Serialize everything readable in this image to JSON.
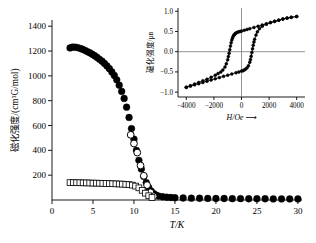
{
  "figure": {
    "background": "#ffffff",
    "foreground": "#000000"
  },
  "chart_data": [
    {
      "id": "main",
      "type": "scatter",
      "title": "",
      "xlabel": "T/K",
      "ylabel": "磁化强度/(cm³G/mol)",
      "xlim": [
        0,
        30.5
      ],
      "ylim": [
        0,
        1450
      ],
      "xticks": [
        0,
        5,
        10,
        15,
        20,
        25,
        30
      ],
      "xticklabels": [
        "0",
        "5",
        "10",
        "15",
        "20",
        "25",
        "30"
      ],
      "yticks": [
        200,
        400,
        600,
        800,
        1000,
        1200,
        1400
      ],
      "yticklabels": [
        "200",
        "400",
        "600",
        "800",
        "1000",
        "1200",
        "1400"
      ],
      "grid": false,
      "legend": false,
      "series": [
        {
          "name": "FC-filled-circles",
          "marker": "filled-circle",
          "x": [
            2.2,
            2.5,
            2.8,
            3.1,
            3.4,
            3.7,
            4.0,
            4.3,
            4.6,
            4.9,
            5.2,
            5.5,
            5.8,
            6.1,
            6.4,
            6.7,
            7.0,
            7.3,
            7.6,
            7.9,
            8.2,
            8.5,
            8.8,
            9.1,
            9.4,
            9.7,
            10.0,
            10.3,
            10.6,
            10.9,
            11.2,
            11.5,
            11.8,
            12.1,
            12.4,
            12.7,
            13.0,
            13.5,
            14.0,
            14.5,
            15.0,
            16.0,
            17.0,
            18.0,
            19.0,
            20.0,
            21.0,
            22.0,
            23.0,
            24.0,
            25.0,
            26.0,
            27.0,
            28.0,
            29.0,
            30.0
          ],
          "y": [
            1225,
            1232,
            1231,
            1228,
            1222,
            1215,
            1206,
            1196,
            1186,
            1175,
            1162,
            1148,
            1133,
            1118,
            1100,
            1080,
            1058,
            1032,
            1003,
            968,
            925,
            875,
            818,
            748,
            665,
            575,
            490,
            400,
            320,
            250,
            190,
            140,
            100,
            72,
            52,
            40,
            32,
            26,
            22,
            20,
            18,
            16,
            15,
            14,
            13,
            12,
            12,
            11,
            11,
            10,
            10,
            10,
            9,
            9,
            9,
            9
          ]
        },
        {
          "name": "ZFC-open-circles",
          "marker": "open-circle",
          "x": [
            9.6,
            10.0,
            10.4,
            10.8,
            11.2,
            11.6,
            12.0,
            12.4
          ],
          "y": [
            525,
            455,
            382,
            278,
            195,
            120,
            62,
            30
          ]
        },
        {
          "name": "open-squares",
          "marker": "open-square",
          "x": [
            2.2,
            2.6,
            3.0,
            3.4,
            3.8,
            4.2,
            4.6,
            5.0,
            5.4,
            5.8,
            6.2,
            6.6,
            7.0,
            7.4,
            7.8,
            8.2,
            8.6,
            9.0,
            9.4,
            9.8,
            10.2,
            10.6,
            11.0,
            11.4,
            11.8,
            12.2
          ],
          "y": [
            140,
            140,
            139,
            139,
            138,
            138,
            137,
            136,
            136,
            135,
            134,
            133,
            132,
            131,
            130,
            129,
            128,
            126,
            124,
            120,
            112,
            98,
            78,
            55,
            34,
            20
          ]
        }
      ]
    },
    {
      "id": "inset",
      "type": "line",
      "title": "",
      "xlabel": "H/Oe ⟶",
      "ylabel": "磁化强度/μʙ",
      "xlim": [
        -4600,
        4600
      ],
      "ylim": [
        -1.12,
        1.08
      ],
      "xticks": [
        -4000,
        -2000,
        0,
        2000,
        4000
      ],
      "xticklabels": [
        "−4000",
        "−2000",
        "0",
        "2000",
        "4000"
      ],
      "yticks": [
        -1.0,
        -0.5,
        0.0,
        0.5,
        1.0
      ],
      "yticklabels": [
        "−1.0",
        "−0.5",
        "0.0",
        "0.5",
        "1.0"
      ],
      "grid": false,
      "legend": false,
      "zero_lines": true,
      "series": [
        {
          "name": "hysteresis-upper-branch",
          "marker": "filled-circle",
          "x": [
            -4000,
            -3700,
            -3400,
            -3100,
            -2800,
            -2500,
            -2200,
            -1900,
            -1700,
            -1500,
            -1350,
            -1200,
            -1100,
            -1000,
            -950,
            -900,
            -850,
            -800,
            -750,
            -700,
            -650,
            -600,
            -550,
            -500,
            -450,
            -400,
            -300,
            -200,
            -100,
            0,
            200,
            400,
            600,
            900,
            1200,
            1500,
            1800,
            2100,
            2400,
            2700,
            3000,
            3300,
            3600,
            4000
          ],
          "y": [
            -0.88,
            -0.84,
            -0.8,
            -0.76,
            -0.72,
            -0.68,
            -0.63,
            -0.58,
            -0.54,
            -0.5,
            -0.45,
            -0.38,
            -0.3,
            -0.2,
            -0.12,
            -0.04,
            0.05,
            0.14,
            0.22,
            0.29,
            0.34,
            0.38,
            0.41,
            0.43,
            0.45,
            0.46,
            0.48,
            0.49,
            0.5,
            0.51,
            0.53,
            0.55,
            0.57,
            0.6,
            0.63,
            0.66,
            0.69,
            0.72,
            0.75,
            0.78,
            0.81,
            0.83,
            0.85,
            0.87
          ]
        },
        {
          "name": "hysteresis-lower-branch",
          "marker": "filled-circle",
          "x": [
            4000,
            3600,
            3300,
            3000,
            2700,
            2400,
            2100,
            1800,
            1500,
            1300,
            1150,
            1050,
            950,
            900,
            850,
            800,
            750,
            700,
            650,
            600,
            500,
            400,
            300,
            200,
            100,
            0,
            -200,
            -400,
            -700,
            -1000,
            -1300,
            -1600,
            -1900,
            -2200,
            -2500,
            -2800,
            -3100,
            -3400,
            -3700,
            -4000
          ],
          "y": [
            0.87,
            0.85,
            0.83,
            0.81,
            0.78,
            0.75,
            0.72,
            0.68,
            0.63,
            0.57,
            0.49,
            0.41,
            0.31,
            0.24,
            0.16,
            0.07,
            -0.02,
            -0.11,
            -0.19,
            -0.26,
            -0.35,
            -0.4,
            -0.43,
            -0.45,
            -0.47,
            -0.48,
            -0.5,
            -0.52,
            -0.55,
            -0.58,
            -0.61,
            -0.64,
            -0.67,
            -0.7,
            -0.73,
            -0.76,
            -0.79,
            -0.82,
            -0.85,
            -0.88
          ]
        }
      ]
    }
  ]
}
